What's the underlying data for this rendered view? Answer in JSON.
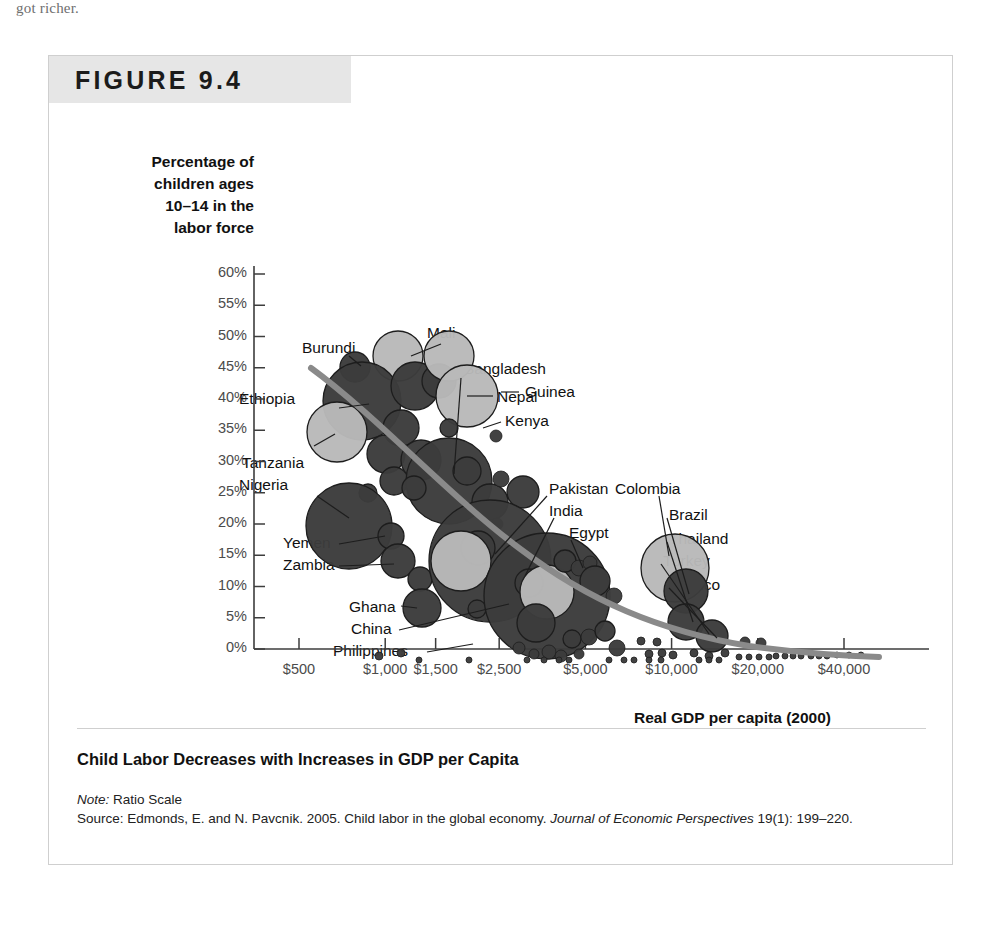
{
  "page": {
    "scan_text_top": "got richer."
  },
  "figure": {
    "label": "FIGURE 9.4",
    "caption_title": "Child Labor Decreases with Increases in GDP per Capita",
    "note_label": "Note:",
    "note_text": "Ratio Scale",
    "source_label": "Source:",
    "source_text_1": "Edmonds, E. and N. Pavcnik. 2005. Child labor in the global economy. ",
    "source_journal": "Journal of Economic Perspectives",
    "source_text_2": " 19(1): 199–220."
  },
  "chart_data": {
    "type": "scatter",
    "title": "Child Labor Decreases with Increases in GDP per Capita",
    "subtitle": "Ratio Scale",
    "xlabel": "Real GDP per capita (2000)",
    "ylabel": "Percentage of children ages 10–14 in the labor force",
    "ylabel_lines": [
      "Percentage of",
      "children ages",
      "10–14 in the",
      "labor force"
    ],
    "grid": false,
    "legend": "none",
    "xscale": "log",
    "yscale": "linear",
    "xticks": [
      500,
      1000,
      1500,
      2500,
      5000,
      10000,
      20000,
      40000
    ],
    "xticklabels": [
      "$500",
      "$1,000",
      "$1,500",
      "$2,500",
      "$5,000",
      "$10,000",
      "$20,000",
      "$40,000"
    ],
    "yticks": [
      0,
      5,
      10,
      15,
      20,
      25,
      30,
      35,
      40,
      45,
      50,
      55,
      60
    ],
    "yticklabels": [
      "0%",
      "5%",
      "10%",
      "15%",
      "20%",
      "25%",
      "30%",
      "35%",
      "40%",
      "45%",
      "50%",
      "55%",
      "60%"
    ],
    "ylim": [
      0,
      62
    ],
    "bubble_meaning": "bubble area ≈ number of children in the labor force; light gray = labeled large economies",
    "trendline": {
      "description": "thick gray downward-sloping fitted curve",
      "color": "#8a8a8a",
      "points": [
        [
          420,
          48
        ],
        [
          700,
          37
        ],
        [
          1200,
          29
        ],
        [
          2200,
          21
        ],
        [
          4000,
          14
        ],
        [
          7000,
          8.5
        ],
        [
          12000,
          5
        ],
        [
          20000,
          3
        ],
        [
          40000,
          1.5
        ]
      ]
    },
    "labeled_points": [
      {
        "name": "Burundi",
        "gdp": 620,
        "pct": 48.5,
        "bubble": "small",
        "shade": "dark"
      },
      {
        "name": "Mali",
        "gdp": 1180,
        "pct": 51.0,
        "bubble": "medium",
        "shade": "light"
      },
      {
        "name": "Ethiopia",
        "gdp": 740,
        "pct": 42.0,
        "bubble": "large",
        "shade": "dark"
      },
      {
        "name": "Nepal",
        "gdp": 1450,
        "pct": 41.0,
        "bubble": "medium",
        "shade": "light"
      },
      {
        "name": "Kenya",
        "gdp": 1750,
        "pct": 38.5,
        "bubble": "tiny",
        "shade": "dark"
      },
      {
        "name": "Tanzania",
        "gdp": 560,
        "pct": 36.5,
        "bubble": "medium",
        "shade": "light"
      },
      {
        "name": "Nigeria",
        "gdp": 850,
        "pct": 25.5,
        "bubble": "large",
        "shade": "dark"
      },
      {
        "name": "Bangladesh",
        "gdp": 1900,
        "pct": 30.0,
        "bubble": "large",
        "shade": "dark"
      },
      {
        "name": "Guinea",
        "gdp": 2100,
        "pct": 31.0,
        "bubble": "small",
        "shade": "dark"
      },
      {
        "name": "Pakistan",
        "gdp": 2100,
        "pct": 17.0,
        "bubble": "xlarge",
        "shade": "dark"
      },
      {
        "name": "India",
        "gdp": 2700,
        "pct": 13.0,
        "bubble": "xlarge",
        "shade": "dark"
      },
      {
        "name": "Egypt",
        "gdp": 3700,
        "pct": 11.0,
        "bubble": "small",
        "shade": "dark"
      },
      {
        "name": "Yemen",
        "gdp": 880,
        "pct": 19.0,
        "bubble": "small",
        "shade": "dark"
      },
      {
        "name": "Zambia",
        "gdp": 900,
        "pct": 15.0,
        "bubble": "small",
        "shade": "dark"
      },
      {
        "name": "Ghana",
        "gdp": 2000,
        "pct": 13.0,
        "bubble": "small",
        "shade": "dark"
      },
      {
        "name": "China",
        "gdp": 3200,
        "pct": 7.5,
        "bubble": "xlarge",
        "shade": "dark"
      },
      {
        "name": "Philippines",
        "gdp": 3600,
        "pct": 1.0,
        "bubble": "small",
        "shade": "dark"
      },
      {
        "name": "Colombia",
        "gdp": 6400,
        "pct": 17.0,
        "bubble": "medium",
        "shade": "light"
      },
      {
        "name": "Brazil",
        "gdp": 7000,
        "pct": 15.5,
        "bubble": "medium",
        "shade": "dark"
      },
      {
        "name": "Thailand",
        "gdp": 7300,
        "pct": 12.0,
        "bubble": "small",
        "shade": "dark"
      },
      {
        "name": "Turkey",
        "gdp": 8200,
        "pct": 10.0,
        "bubble": "small",
        "shade": "dark"
      },
      {
        "name": "Mexico",
        "gdp": 9500,
        "pct": 5.5,
        "bubble": "small",
        "shade": "dark"
      }
    ],
    "colors": {
      "bubble_dark": "#3c3c3c",
      "bubble_light": "#b9b9b9",
      "bubble_stroke": "#1d1d1d",
      "trend": "#8a8a8a",
      "axis": "#3d3d3d",
      "tick_text": "#4b4b4b"
    },
    "callout_labels": [
      "Burundi",
      "Mali",
      "Ethiopia",
      "Nepal",
      "Kenya",
      "Tanzania",
      "Nigeria",
      "Bangladesh",
      "Guinea",
      "Pakistan",
      "India",
      "Egypt",
      "Yemen",
      "Zambia",
      "Ghana",
      "China",
      "Philippines",
      "Colombia",
      "Brazil",
      "Thailand",
      "Turkey",
      "Mexico"
    ]
  }
}
